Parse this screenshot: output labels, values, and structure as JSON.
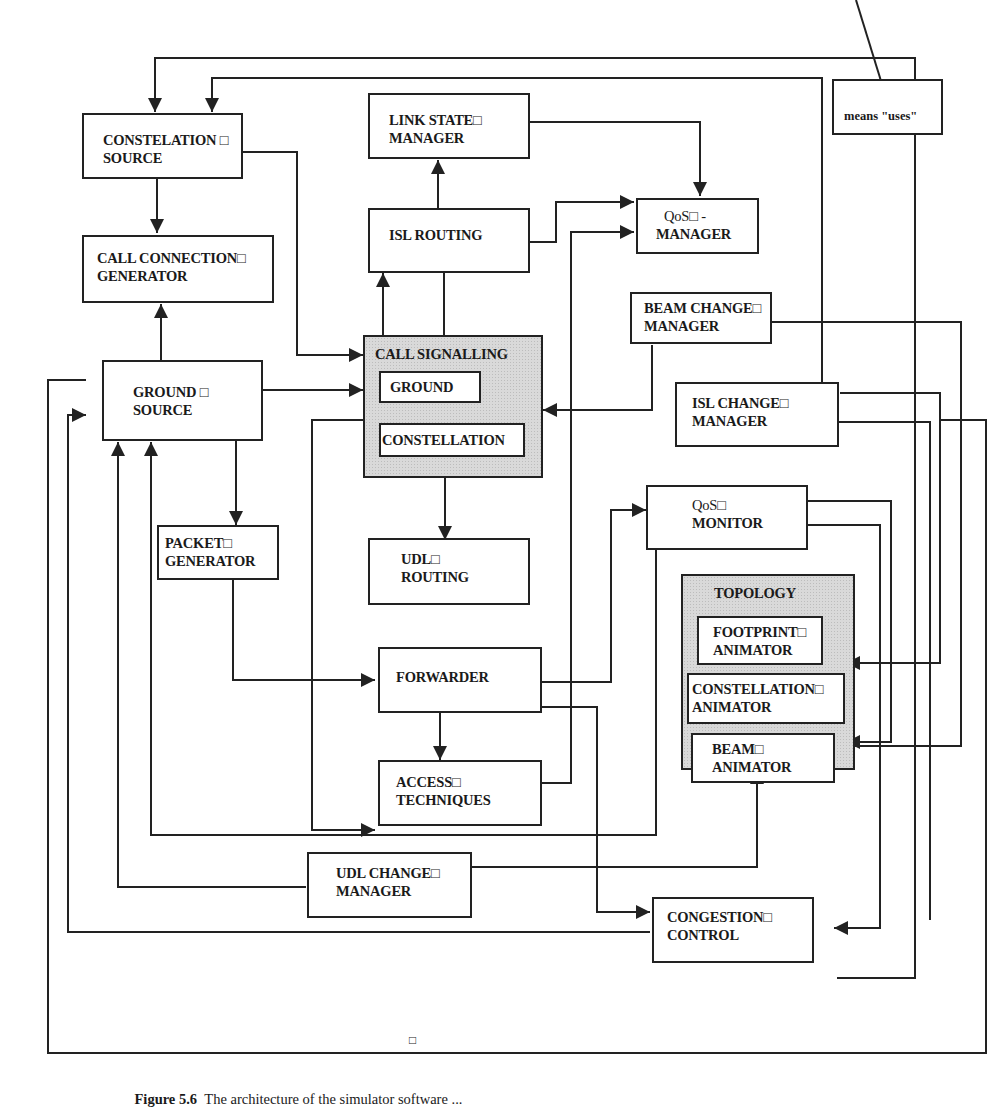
{
  "figure": {
    "caption_label": "Figure 5.6",
    "caption_text": "The architecture of the simulator software ..."
  },
  "legend": {
    "arrow_meaning": "means \"uses\""
  },
  "modules": {
    "constelation_source": {
      "line1": "CONSTELATION □",
      "line2": "SOURCE"
    },
    "link_state_manager": {
      "line1": "LINK STATE□",
      "line2": "MANAGER"
    },
    "isl_routing": {
      "line1": "ISL ROUTING"
    },
    "qos_manager": {
      "line1": "QoS□ -",
      "line2": "MANAGER"
    },
    "call_connection_generator": {
      "line1": "CALL CONNECTION□",
      "line2": "GENERATOR"
    },
    "call_signalling": {
      "title": "CALL SIGNALLING",
      "sub1": "GROUND",
      "sub2": "CONSTELLATION"
    },
    "beam_change_manager": {
      "line1": "BEAM CHANGE□",
      "line2": "MANAGER"
    },
    "ground_source": {
      "line1": "GROUND □",
      "line2": "SOURCE"
    },
    "isl_change_manager": {
      "line1": "ISL CHANGE□",
      "line2": "MANAGER"
    },
    "packet_generator": {
      "line1": "PACKET□",
      "line2": "GENERATOR"
    },
    "udl_routing": {
      "line1": "UDL□",
      "line2": "ROUTING"
    },
    "qos_monitor": {
      "line1": "QoS□",
      "line2": "MONITOR"
    },
    "topology": {
      "title": "TOPOLOGY",
      "footprint": {
        "line1": "FOOTPRINT□",
        "line2": "ANIMATOR"
      },
      "constellation": {
        "line1": "CONSTELLATION□",
        "line2": "ANIMATOR"
      },
      "beam": {
        "line1": "BEAM□",
        "line2": "ANIMATOR"
      }
    },
    "forwarder": {
      "line1": "FORWARDER"
    },
    "access_techniques": {
      "line1": "ACCESS□",
      "line2": "TECHNIQUES"
    },
    "udl_change_manager": {
      "line1": "UDL CHANGE□",
      "line2": "MANAGER"
    },
    "congestion_control": {
      "line1": "CONGESTION□",
      "line2": "CONTROL"
    }
  },
  "stray_marker": "□",
  "colors": {
    "line": "#222222",
    "shade": "#d9d9d9",
    "background": "#ffffff"
  }
}
